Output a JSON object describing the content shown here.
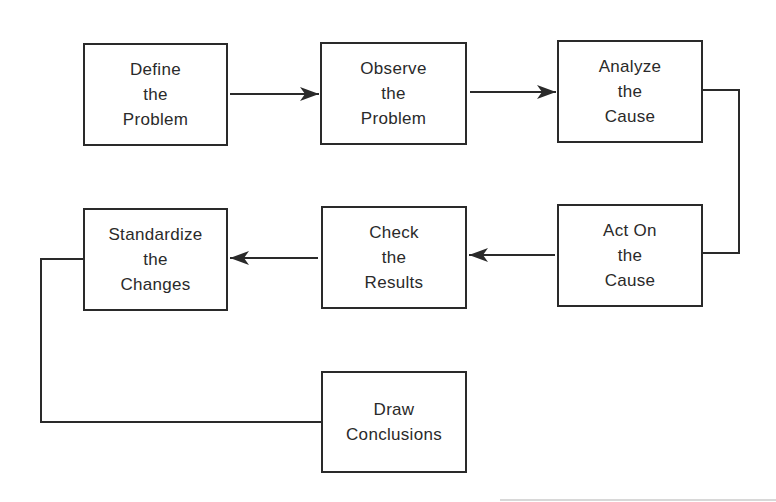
{
  "diagram": {
    "type": "process-flowchart",
    "nodes": [
      {
        "id": "define",
        "lines": [
          "Define",
          "the",
          "Problem"
        ],
        "x": 83,
        "y": 43,
        "w": 145,
        "h": 103
      },
      {
        "id": "observe",
        "lines": [
          "Observe",
          "the",
          "Problem"
        ],
        "x": 320,
        "y": 42,
        "w": 147,
        "h": 103
      },
      {
        "id": "analyze",
        "lines": [
          "Analyze",
          "the",
          "Cause"
        ],
        "x": 557,
        "y": 40,
        "w": 146,
        "h": 103
      },
      {
        "id": "act",
        "lines": [
          "Act On",
          "the",
          "Cause"
        ],
        "x": 557,
        "y": 204,
        "w": 146,
        "h": 103
      },
      {
        "id": "check",
        "lines": [
          "Check",
          "the",
          "Results"
        ],
        "x": 321,
        "y": 206,
        "w": 146,
        "h": 103
      },
      {
        "id": "standardize",
        "lines": [
          "Standardize",
          "the",
          "Changes"
        ],
        "x": 83,
        "y": 208,
        "w": 145,
        "h": 103
      },
      {
        "id": "draw",
        "lines": [
          "Draw",
          "Conclusions"
        ],
        "x": 321,
        "y": 371,
        "w": 146,
        "h": 102
      }
    ],
    "edges": [
      {
        "from": "define",
        "to": "observe",
        "arrow": true
      },
      {
        "from": "observe",
        "to": "analyze",
        "arrow": true
      },
      {
        "from": "analyze",
        "to": "act",
        "arrow": false
      },
      {
        "from": "act",
        "to": "check",
        "arrow": true
      },
      {
        "from": "check",
        "to": "standardize",
        "arrow": true
      },
      {
        "from": "standardize",
        "to": "draw",
        "arrow": false
      }
    ],
    "colors": {
      "stroke": "#2a2a2a",
      "background": "#ffffff"
    }
  }
}
